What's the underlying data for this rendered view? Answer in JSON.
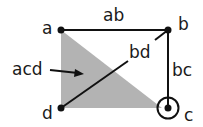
{
  "diagram": {
    "nodes": [
      {
        "id": "a",
        "label": "a"
      },
      {
        "id": "b",
        "label": "b"
      },
      {
        "id": "c",
        "label": "c",
        "marked": true
      },
      {
        "id": "d",
        "label": "d"
      }
    ],
    "edges": [
      {
        "id": "ab",
        "label": "ab"
      },
      {
        "id": "bc",
        "label": "bc"
      },
      {
        "id": "bd",
        "label": "bd"
      }
    ],
    "faces": [
      {
        "id": "acd",
        "label": "acd"
      }
    ],
    "colors": {
      "fill": "#b3b3b3",
      "stroke": "#111111",
      "text": "#1a1a1a"
    }
  }
}
